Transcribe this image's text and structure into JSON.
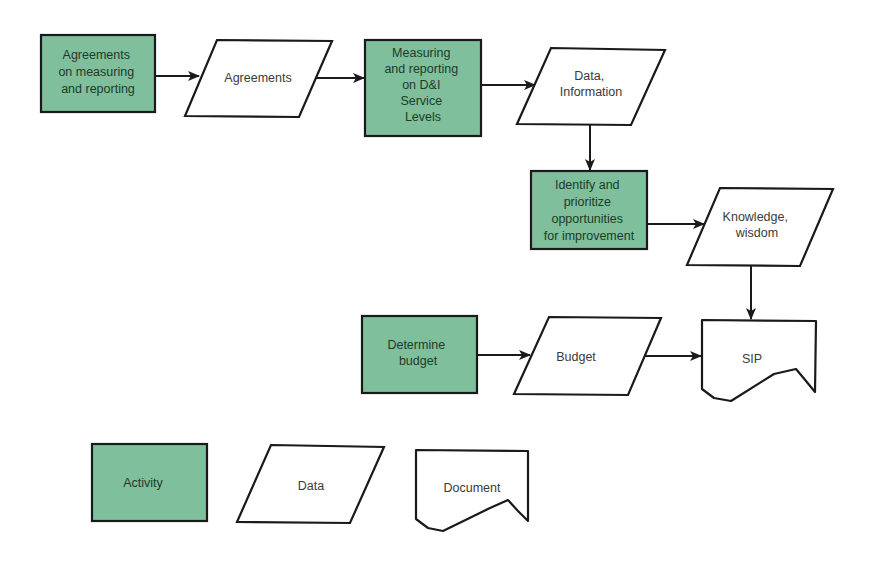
{
  "diagram": {
    "type": "flowchart",
    "colors": {
      "activity_fill": "#7fbf9c",
      "stroke": "#1a1a1a",
      "background": "#ffffff"
    },
    "nodes": [
      {
        "id": "n1",
        "shape": "activity",
        "lines": [
          "Agreements",
          "on measuring",
          "and reporting"
        ]
      },
      {
        "id": "n2",
        "shape": "data",
        "lines": [
          "Agreements"
        ]
      },
      {
        "id": "n3",
        "shape": "activity",
        "lines": [
          "Measuring",
          "and reporting",
          "on D&I",
          "Service",
          "Levels"
        ]
      },
      {
        "id": "n4",
        "shape": "data",
        "lines": [
          "Data,",
          "Information"
        ]
      },
      {
        "id": "n5",
        "shape": "activity",
        "lines": [
          "Identify and",
          "prioritize",
          "opportunities",
          "for improvement"
        ]
      },
      {
        "id": "n6",
        "shape": "data",
        "lines": [
          "Knowledge,",
          "wisdom"
        ]
      },
      {
        "id": "n7",
        "shape": "activity",
        "lines": [
          "Determine",
          "budget"
        ]
      },
      {
        "id": "n8",
        "shape": "data",
        "lines": [
          "Budget"
        ]
      },
      {
        "id": "n9",
        "shape": "document",
        "lines": [
          "SIP"
        ]
      }
    ],
    "edges": [
      {
        "from": "n1",
        "to": "n2"
      },
      {
        "from": "n2",
        "to": "n3"
      },
      {
        "from": "n3",
        "to": "n4"
      },
      {
        "from": "n4",
        "to": "n5"
      },
      {
        "from": "n5",
        "to": "n6"
      },
      {
        "from": "n6",
        "to": "n9"
      },
      {
        "from": "n7",
        "to": "n8"
      },
      {
        "from": "n8",
        "to": "n9"
      }
    ],
    "legend": [
      {
        "shape": "activity",
        "label": "Activity"
      },
      {
        "shape": "data",
        "label": "Data"
      },
      {
        "shape": "document",
        "label": "Document"
      }
    ]
  }
}
